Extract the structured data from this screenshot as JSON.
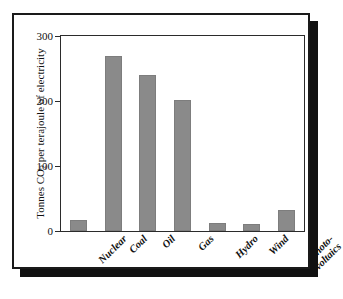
{
  "figure": {
    "frame_color": "#1a1a1a",
    "shadow_color": "#111111",
    "background": "#ffffff"
  },
  "chart_data": {
    "type": "bar",
    "title": "",
    "subtitle": "",
    "xlabel": "",
    "ylabel": "Tonnes CO2 per terajoule of electricity",
    "ylabel_parts": {
      "pre": "Tonnes CO",
      "sub": "2",
      "post": " per terajoule of electricity"
    },
    "categories": [
      "Nuclear",
      "Coal",
      "Oil",
      "Gas",
      "Hydro",
      "Wind",
      "Photo-voltaics"
    ],
    "category_lines": [
      [
        "Nuclear"
      ],
      [
        "Coal"
      ],
      [
        "Oil"
      ],
      [
        "Gas"
      ],
      [
        "Hydro"
      ],
      [
        "Wind"
      ],
      [
        "Photo-",
        "voltaics"
      ]
    ],
    "values": [
      17,
      270,
      240,
      202,
      13,
      11,
      33
    ],
    "ylim": [
      0,
      300
    ],
    "yticks": [
      0,
      100,
      200,
      300
    ],
    "ytick_labels": [
      "0",
      "100",
      "200",
      "300"
    ],
    "grid": false,
    "legend": false,
    "bar_color": "#8a8a8a",
    "axis_color": "#2b2b2b"
  }
}
